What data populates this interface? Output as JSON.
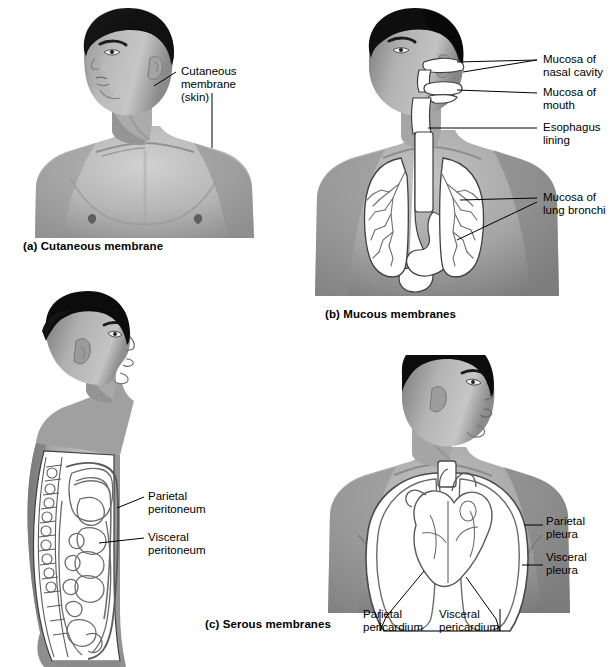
{
  "figure": {
    "background_color": "#ffffff",
    "panels": [
      {
        "id": "a",
        "caption": "(a) Cutaneous membrane",
        "subject": "anterior view of male head and upper torso",
        "labels": [
          {
            "name": "cutaneous-membrane",
            "text": "Cutaneous\nmembrane\n(skin)"
          }
        ]
      },
      {
        "id": "b",
        "caption": "(b) Mucous membranes",
        "subject": "anterior view of male torso showing respiratory and digestive tract linings",
        "labels": [
          {
            "name": "mucosa-nasal-cavity",
            "text": "Mucosa of\nnasal cavity"
          },
          {
            "name": "mucosa-mouth",
            "text": "Mucosa of\nmouth"
          },
          {
            "name": "esophagus-lining",
            "text": "Esophagus\nlining"
          },
          {
            "name": "mucosa-lung-bronchi",
            "text": "Mucosa of\nlung bronchi"
          }
        ]
      },
      {
        "id": "c",
        "caption": "(c) Serous membranes",
        "subject": "lateral view of male trunk (peritoneum) and anterior view of thorax (pleura and pericardium)",
        "labels": [
          {
            "name": "parietal-peritoneum",
            "text": "Parietal\nperitoneum"
          },
          {
            "name": "visceral-peritoneum",
            "text": "Visceral\nperitoneum"
          },
          {
            "name": "parietal-pleura",
            "text": "Parietal\npleura"
          },
          {
            "name": "visceral-pleura",
            "text": "Visceral\npleura"
          },
          {
            "name": "parietal-pericardium",
            "text": "Parietal\npericardium"
          },
          {
            "name": "visceral-pericardium",
            "text": "Visceral\npericardium"
          }
        ]
      }
    ]
  }
}
